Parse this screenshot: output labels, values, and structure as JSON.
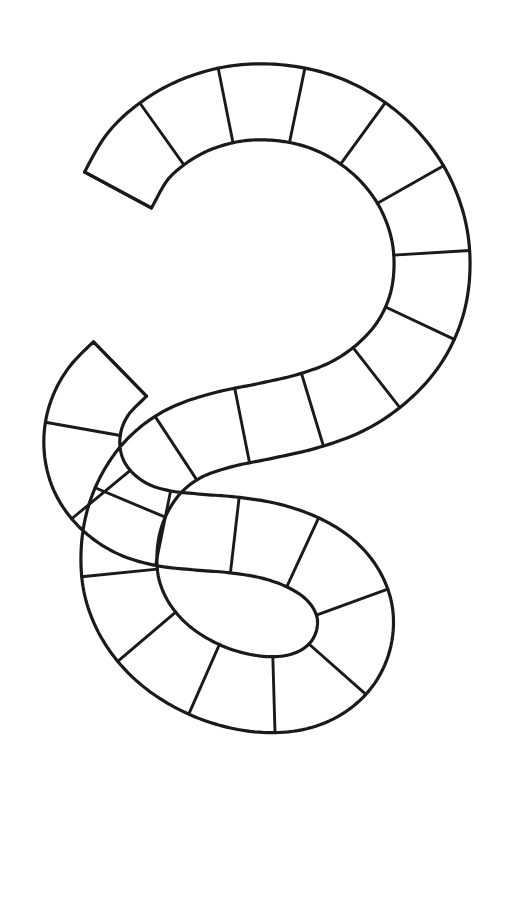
{
  "canvas": {
    "width": 526,
    "height": 903,
    "background": "#ffffff"
  },
  "figure": {
    "name": "s-shaped-game-track",
    "line_color": "#1a1a1a",
    "fill_color": "#ffffff",
    "stroke_width": 3.2,
    "divider_stroke_width": 2.9,
    "track_half_width": 38,
    "space_count": 24,
    "bounds": {
      "left": 48,
      "top": 64,
      "right": 492,
      "bottom": 848
    }
  },
  "chart_data": {
    "type": "diagram",
    "title": "",
    "centerline_points": [
      [
        118,
        190
      ],
      [
        138,
        156
      ],
      [
        166,
        131
      ],
      [
        200,
        113
      ],
      [
        240,
        103
      ],
      [
        282,
        103
      ],
      [
        322,
        112
      ],
      [
        358,
        130
      ],
      [
        389,
        156
      ],
      [
        413,
        189
      ],
      [
        428,
        228
      ],
      [
        432,
        268
      ],
      [
        426,
        307
      ],
      [
        409,
        343
      ],
      [
        382,
        373
      ],
      [
        348,
        396
      ],
      [
        308,
        411
      ],
      [
        265,
        421
      ],
      [
        222,
        430
      ],
      [
        185,
        443
      ],
      [
        157,
        463
      ],
      [
        137,
        489
      ],
      [
        124,
        520
      ],
      [
        119,
        554
      ],
      [
        122,
        588
      ],
      [
        135,
        620
      ],
      [
        157,
        648
      ],
      [
        186,
        670
      ],
      [
        221,
        686
      ],
      [
        258,
        694
      ],
      [
        292,
        693
      ],
      [
        320,
        683
      ],
      [
        341,
        665
      ],
      [
        353,
        641
      ],
      [
        355,
        614
      ],
      [
        346,
        589
      ],
      [
        328,
        568
      ],
      [
        302,
        552
      ],
      [
        270,
        541
      ],
      [
        234,
        535
      ],
      [
        197,
        532
      ],
      [
        162,
        528
      ],
      [
        131,
        518
      ],
      [
        106,
        500
      ],
      [
        89,
        476
      ],
      [
        82,
        448
      ],
      [
        85,
        419
      ],
      [
        98,
        392
      ],
      [
        120,
        369
      ]
    ],
    "space_boundaries_t": [
      0.0,
      0.042,
      0.083,
      0.125,
      0.167,
      0.208,
      0.25,
      0.292,
      0.333,
      0.375,
      0.417,
      0.458,
      0.5,
      0.542,
      0.583,
      0.625,
      0.667,
      0.708,
      0.75,
      0.792,
      0.833,
      0.875,
      0.917,
      0.958,
      1.0
    ]
  },
  "accessibility": {
    "alt_text": "An outline drawing of a letter S formed by a wide track divided into rectangular game board spaces."
  }
}
